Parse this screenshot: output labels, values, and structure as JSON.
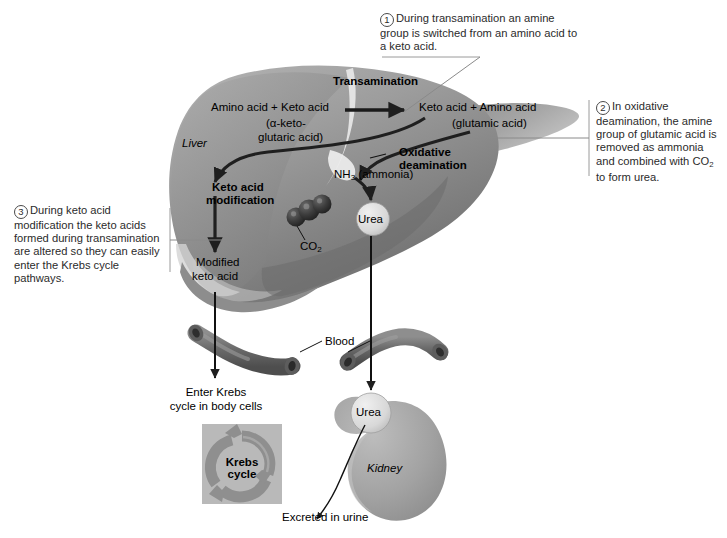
{
  "figure": {
    "title_implied": "Amino acid metabolism in the liver and urea excretion",
    "callouts": [
      {
        "id": "callout-1",
        "number": "1",
        "text": "During transamination an amine group is switched from an amino acid to a keto acid."
      },
      {
        "id": "callout-2",
        "number": "2",
        "text_before_sub": "In oxidative deamination, the amine group of glutamic acid is removed as ammonia and combined with CO",
        "sub": "2",
        "text_after_sub": " to form urea."
      },
      {
        "id": "callout-3",
        "number": "3",
        "text": "During keto acid modification the keto acids formed during transamination are altered so they can easily enter the Krebs cycle pathways."
      }
    ],
    "labels": {
      "transamination": "Transamination",
      "reactants": "Amino acid + Keto acid",
      "reactants_sub1": "(α-keto-",
      "reactants_sub2": "glutaric acid)",
      "products": "Keto acid + Amino acid",
      "products_sub": "(glutamic acid)",
      "liver": "Liver",
      "oxidative_line1": "Oxidative",
      "oxidative_line2": "deamination",
      "ammonia_formula": "NH",
      "ammonia_sub": "3",
      "ammonia_name": " (ammonia)",
      "keto_mod_line1": "Keto acid",
      "keto_mod_line2": "modification",
      "modified_line1": "Modified",
      "modified_line2": "keto acid",
      "co2_formula": "CO",
      "co2_sub": "2",
      "urea_liver": "Urea",
      "blood": "Blood",
      "enter_krebs_line1": "Enter Krebs",
      "enter_krebs_line2": "cycle in body cells",
      "krebs_line1": "Krebs",
      "krebs_line2": "cycle",
      "urea_kidney": "Urea",
      "kidney": "Kidney",
      "excreted": "Excreted in urine"
    },
    "colors": {
      "liver_mid": "#9a9a9a",
      "liver_dark": "#6f6f6f",
      "liver_light": "#c2c2c2",
      "vessel": "#6d6d6d",
      "kidney": "#a8a8a8",
      "krebs_box": "#b9b9b9",
      "krebs_ring": "#8c8c8c",
      "arrow": "#1a1a1a",
      "leader": "#8a8a8a",
      "urea_circle": "#dcdcdc",
      "co2_sphere": "#3a3a3a",
      "text": "#000000",
      "callout_text": "#2b2b2b"
    }
  }
}
